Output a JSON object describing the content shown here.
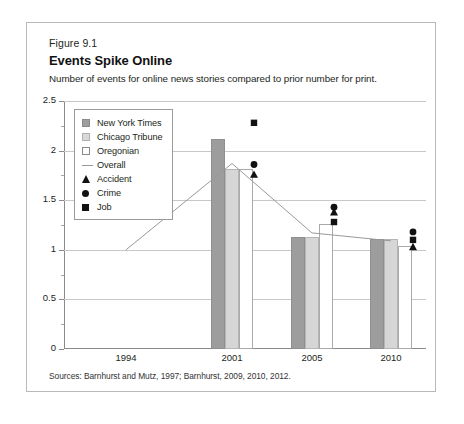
{
  "figure": {
    "number": "Figure 9.1",
    "title": "Events Spike Online",
    "subtitle": "Number of events for online news stories compared to prior number for print.",
    "source": "Sources: Barnhurst and Mutz, 1997; Barnhurst, 2009, 2010, 2012."
  },
  "chart_data": {
    "type": "bar",
    "title": "Events Spike Online",
    "subtitle": "Number of events for online news stories compared to prior number for print.",
    "xlabel": "",
    "ylabel": "",
    "ylim": [
      0,
      2.5
    ],
    "yticks": [
      0,
      0.5,
      1,
      1.5,
      2,
      2.5
    ],
    "ytick_labels": [
      "0",
      "0.5",
      "1",
      "1.5",
      "2",
      "2.5"
    ],
    "yminor_step": 0.25,
    "grid": "horizontal",
    "legend_position": "inside-upper-left",
    "categories": [
      "1994",
      "2001",
      "2005",
      "2010"
    ],
    "series": [
      {
        "name": "New York Times",
        "type": "bar",
        "color": "#9d9d9d",
        "values": [
          null,
          2.12,
          1.13,
          1.11
        ]
      },
      {
        "name": "Chicago Tribune",
        "type": "bar",
        "color": "#d6d6d6",
        "values": [
          null,
          1.81,
          1.13,
          1.11
        ]
      },
      {
        "name": "Oregonian",
        "type": "bar",
        "color": "#ffffff",
        "values": [
          null,
          1.81,
          1.26,
          1.04
        ]
      },
      {
        "name": "Overall",
        "type": "line",
        "color": "#999999",
        "values": [
          1.0,
          1.87,
          1.17,
          1.09
        ]
      },
      {
        "name": "Accident",
        "type": "marker",
        "marker": "triangle",
        "color": "#111111",
        "points": [
          {
            "x": 2001,
            "y": 1.76
          },
          {
            "x": 2005,
            "y": 1.38
          },
          {
            "x": 2010,
            "y": 1.03
          }
        ]
      },
      {
        "name": "Crime",
        "type": "marker",
        "marker": "circle",
        "color": "#111111",
        "points": [
          {
            "x": 2001,
            "y": 1.86
          },
          {
            "x": 2005,
            "y": 1.43
          },
          {
            "x": 2010,
            "y": 1.18
          }
        ]
      },
      {
        "name": "Job",
        "type": "marker",
        "marker": "square",
        "color": "#111111",
        "points": [
          {
            "x": 2001,
            "y": 2.28
          },
          {
            "x": 2005,
            "y": 1.28
          },
          {
            "x": 2010,
            "y": 1.1
          }
        ]
      }
    ],
    "legend": [
      {
        "label": "New York Times",
        "key": "nyt"
      },
      {
        "label": "Chicago Tribune",
        "key": "ct"
      },
      {
        "label": "Oregonian",
        "key": "or"
      },
      {
        "label": "Overall",
        "key": "line"
      },
      {
        "label": "Accident",
        "key": "tri"
      },
      {
        "label": "Crime",
        "key": "cir"
      },
      {
        "label": "Job",
        "key": "sq"
      }
    ]
  }
}
